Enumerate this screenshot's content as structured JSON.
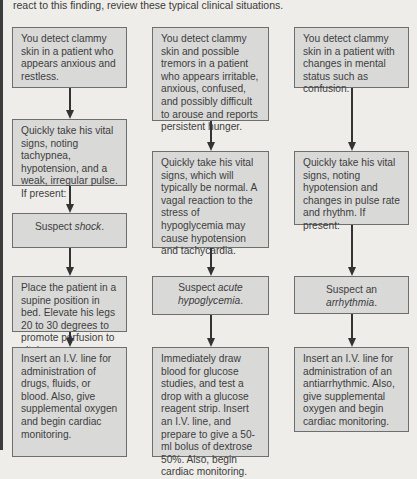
{
  "intro": {
    "text": "react to this finding, review these typical clinical situations."
  },
  "columns": [
    {
      "name": "shock",
      "boxes": [
        {
          "text": "You detect clammy skin in a patient who appears anxious and restless."
        },
        {
          "text": "Quickly take his vital signs, noting tachypnea, hypotension, and a weak, irregular pulse. If present:"
        },
        {
          "prefix": "Suspect ",
          "emphasis": "shock",
          "suffix": "."
        },
        {
          "text": "Place the patient in a supine position in bed. Elevate his legs 20 to 30 degrees to promote perfusion to vital organs."
        },
        {
          "text": "Insert an I.V. line for administration of drugs, fluids, or blood. Also, give supplemental oxygen and begin cardiac monitoring."
        }
      ]
    },
    {
      "name": "hypoglycemia",
      "boxes": [
        {
          "text": "You detect clammy skin and possible tremors in a patient who appears irritable, anxious, confused, and possibly difficult to arouse and reports persistent hunger."
        },
        {
          "text": "Quickly take his vital signs, which will typically be normal. A vagal reaction to the stress of hypoglycemia may cause hypotension and tachycardia."
        },
        {
          "prefix": "Suspect ",
          "emphasis": "acute hypoglycemia",
          "suffix": "."
        },
        {
          "text": "Immediately draw blood for glucose studies, and test a drop with a glucose reagent strip. Insert an I.V. line, and prepare to give a 50-ml bolus of dextrose 50%. Also, begin cardiac monitoring."
        }
      ]
    },
    {
      "name": "arrhythmia",
      "boxes": [
        {
          "text": "You detect clammy skin in a patient with changes in mental status such as confusion."
        },
        {
          "text": "Quickly take his vital signs, noting hypotension and changes in pulse rate and rhythm. If present:"
        },
        {
          "prefix": "Suspect an ",
          "emphasis": "arrhythmia",
          "suffix": "."
        },
        {
          "text": "Insert an I.V. line for administration of an antiarrhythmic. Also, give supplemental oxygen and begin cardiac monitoring."
        }
      ]
    }
  ],
  "colors": {
    "background": "#eeede9",
    "box_fill": "#d9d9d8",
    "box_border": "#6e6e6e",
    "arrow": "#333333",
    "text": "#3d3d3d"
  }
}
